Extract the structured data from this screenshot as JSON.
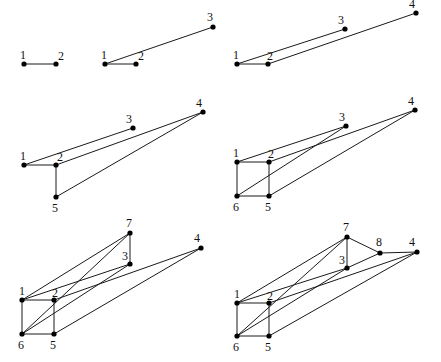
{
  "diagram": {
    "title": "",
    "colors": {
      "edge": "#1a1a1a",
      "node": "#000000",
      "label": "#111111",
      "background": "#ffffff"
    },
    "panels": [
      {
        "id": "step-1",
        "nodes": [
          {
            "id": "1",
            "x": 24,
            "y": 64,
            "lx": -4,
            "ly": -5
          },
          {
            "id": "2",
            "x": 56,
            "y": 64,
            "lx": 2,
            "ly": -4
          }
        ],
        "edges": [
          [
            "1",
            "2"
          ]
        ]
      },
      {
        "id": "step-2",
        "nodes": [
          {
            "id": "1",
            "x": 105,
            "y": 64,
            "lx": -4,
            "ly": -5
          },
          {
            "id": "2",
            "x": 136,
            "y": 64,
            "lx": 2,
            "ly": -4
          },
          {
            "id": "3",
            "x": 213,
            "y": 27,
            "lx": -6,
            "ly": -6
          }
        ],
        "edges": [
          [
            "1",
            "2"
          ],
          [
            "1",
            "3"
          ]
        ]
      },
      {
        "id": "step-3",
        "nodes": [
          {
            "id": "1",
            "x": 237,
            "y": 64,
            "lx": -4,
            "ly": -5
          },
          {
            "id": "2",
            "x": 268,
            "y": 64,
            "lx": -1,
            "ly": -4
          },
          {
            "id": "3",
            "x": 345,
            "y": 29,
            "lx": -7,
            "ly": -5
          },
          {
            "id": "4",
            "x": 416,
            "y": 13,
            "lx": -7,
            "ly": -5
          }
        ],
        "edges": [
          [
            "1",
            "2"
          ],
          [
            "1",
            "3"
          ],
          [
            "2",
            "4"
          ]
        ]
      },
      {
        "id": "step-4",
        "nodes": [
          {
            "id": "1",
            "x": 24,
            "y": 165,
            "lx": -4,
            "ly": -5
          },
          {
            "id": "2",
            "x": 56,
            "y": 165,
            "lx": 1,
            "ly": -4
          },
          {
            "id": "3",
            "x": 133,
            "y": 128,
            "lx": -7,
            "ly": -5
          },
          {
            "id": "4",
            "x": 203,
            "y": 112,
            "lx": -7,
            "ly": -5
          },
          {
            "id": "5",
            "x": 56,
            "y": 197,
            "lx": -4,
            "ly": 15
          }
        ],
        "edges": [
          [
            "1",
            "2"
          ],
          [
            "1",
            "3"
          ],
          [
            "2",
            "4"
          ],
          [
            "2",
            "5"
          ],
          [
            "5",
            "4"
          ]
        ]
      },
      {
        "id": "step-5",
        "nodes": [
          {
            "id": "1",
            "x": 237,
            "y": 162,
            "lx": -4,
            "ly": -5
          },
          {
            "id": "2",
            "x": 269,
            "y": 162,
            "lx": -1,
            "ly": -4
          },
          {
            "id": "3",
            "x": 346,
            "y": 126,
            "lx": -7,
            "ly": -5
          },
          {
            "id": "4",
            "x": 415,
            "y": 110,
            "lx": -7,
            "ly": -5
          },
          {
            "id": "6",
            "x": 237,
            "y": 196,
            "lx": -4,
            "ly": 15
          },
          {
            "id": "5",
            "x": 269,
            "y": 196,
            "lx": -4,
            "ly": 15
          }
        ],
        "edges": [
          [
            "1",
            "2"
          ],
          [
            "1",
            "3"
          ],
          [
            "2",
            "4"
          ],
          [
            "1",
            "6"
          ],
          [
            "2",
            "5"
          ],
          [
            "6",
            "5"
          ],
          [
            "6",
            "3"
          ],
          [
            "5",
            "4"
          ]
        ]
      },
      {
        "id": "step-6",
        "nodes": [
          {
            "id": "7",
            "x": 130,
            "y": 233,
            "lx": -4,
            "ly": -6
          },
          {
            "id": "3",
            "x": 130,
            "y": 264,
            "lx": -8,
            "ly": -4
          },
          {
            "id": "4",
            "x": 201,
            "y": 248,
            "lx": -7,
            "ly": -6
          },
          {
            "id": "1",
            "x": 22,
            "y": 300,
            "lx": -3,
            "ly": -5
          },
          {
            "id": "2",
            "x": 54,
            "y": 300,
            "lx": -2,
            "ly": -3
          },
          {
            "id": "6",
            "x": 22,
            "y": 334,
            "lx": -4,
            "ly": 15
          },
          {
            "id": "5",
            "x": 54,
            "y": 334,
            "lx": -4,
            "ly": 15
          }
        ],
        "edges": [
          [
            "1",
            "2"
          ],
          [
            "1",
            "6"
          ],
          [
            "2",
            "5"
          ],
          [
            "6",
            "5"
          ],
          [
            "1",
            "3"
          ],
          [
            "2",
            "4"
          ],
          [
            "6",
            "3"
          ],
          [
            "5",
            "4"
          ],
          [
            "1",
            "7"
          ],
          [
            "6",
            "7"
          ],
          [
            "7",
            "3"
          ]
        ]
      },
      {
        "id": "step-7",
        "nodes": [
          {
            "id": "7",
            "x": 347,
            "y": 237,
            "lx": -4,
            "ly": -6
          },
          {
            "id": "8",
            "x": 380,
            "y": 253,
            "lx": -4,
            "ly": -7
          },
          {
            "id": "4",
            "x": 417,
            "y": 252,
            "lx": -8,
            "ly": -6
          },
          {
            "id": "3",
            "x": 347,
            "y": 268,
            "lx": -8,
            "ly": -4
          },
          {
            "id": "1",
            "x": 237,
            "y": 303,
            "lx": -3,
            "ly": -5
          },
          {
            "id": "2",
            "x": 269,
            "y": 303,
            "lx": -2,
            "ly": -3
          },
          {
            "id": "6",
            "x": 237,
            "y": 336,
            "lx": -4,
            "ly": 15
          },
          {
            "id": "5",
            "x": 269,
            "y": 336,
            "lx": -4,
            "ly": 15
          }
        ],
        "edges": [
          [
            "1",
            "2"
          ],
          [
            "1",
            "6"
          ],
          [
            "2",
            "5"
          ],
          [
            "6",
            "5"
          ],
          [
            "1",
            "3"
          ],
          [
            "2",
            "4"
          ],
          [
            "6",
            "3"
          ],
          [
            "5",
            "4"
          ],
          [
            "1",
            "7"
          ],
          [
            "6",
            "7"
          ],
          [
            "7",
            "3"
          ],
          [
            "7",
            "8"
          ],
          [
            "8",
            "4"
          ],
          [
            "3",
            "8"
          ]
        ]
      }
    ]
  }
}
